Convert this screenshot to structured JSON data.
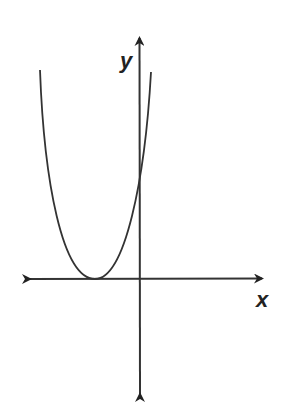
{
  "diagram": {
    "type": "parabola-graph",
    "axes": {
      "x_label": "x",
      "y_label": "y",
      "color": "#333333"
    },
    "curve": {
      "description": "Upward-opening parabola with vertex on the negative x-axis, tangent to the x-axis, crossing the positive y-axis",
      "color": "#333333",
      "vertex_px": [
        95,
        279
      ],
      "left_end_px": [
        40,
        70
      ],
      "right_end_px": [
        151,
        72
      ],
      "y_intercept_px": [
        140,
        178
      ]
    }
  }
}
